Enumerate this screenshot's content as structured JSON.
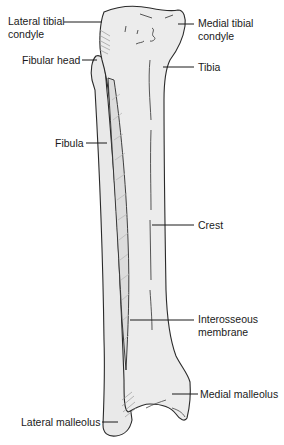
{
  "diagram": {
    "colors": {
      "bone_fill": "#ececec",
      "bone_fill_dark": "#dedede",
      "outline": "#2a2a2a",
      "membrane_hatch": "#b8b8b8",
      "label_text": "#1a1a1a",
      "leader": "#1a1a1a"
    },
    "labels": {
      "lateral_tibial_condyle": "Lateral tibial\ncondyle",
      "medial_tibial_condyle": "Medial tibial\ncondyle",
      "fibular_head": "Fibular head",
      "tibia": "Tibia",
      "fibula": "Fibula",
      "crest": "Crest",
      "interosseous_membrane": "Interosseous\nmembrane",
      "medial_malleolus": "Medial malleolus",
      "lateral_malleolus": "Lateral malleolus"
    }
  }
}
